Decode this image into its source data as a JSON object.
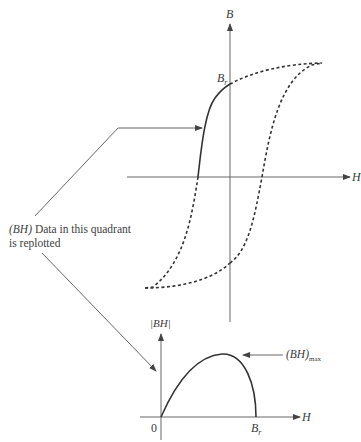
{
  "diagram": {
    "title": "",
    "hysteresis_loop": {
      "y_axis_label": "B",
      "x_axis_label": "H",
      "remanence_label": "B",
      "remanence_subscript": "r",
      "solid_segment": "second-quadrant demagnetization curve (from -Hc to Br)",
      "dashed_segment": "remainder of hysteresis loop"
    },
    "annotation": {
      "line1_prefix": "(BH)",
      "line1_rest": " Data in this quadrant",
      "line2": "is replotted"
    },
    "energy_product_plot": {
      "y_axis_label": "|BH|",
      "x_axis_label": "H",
      "origin_label": "0",
      "end_label": "B",
      "end_subscript": "r",
      "max_label": "(BH)",
      "max_subscript": "max"
    },
    "colors": {
      "line": "#333333",
      "axis": "#555555",
      "text": "#3a3a3a",
      "background": "#ffffff"
    }
  }
}
